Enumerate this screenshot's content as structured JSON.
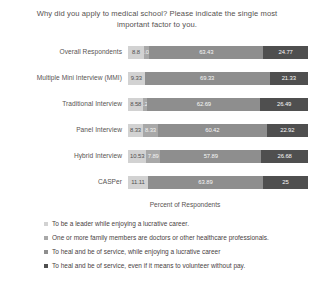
{
  "chart_data": {
    "type": "bar",
    "orientation": "horizontal",
    "stacked": true,
    "stack_mode": "percent",
    "title": "Why did you apply to medical school? Please indicate the single most important factor to you.",
    "xlabel": "Percent of Respondents",
    "ylabel": "",
    "xlim": [
      0,
      100
    ],
    "grid": false,
    "legend_position": "bottom-left",
    "categories": [
      "Overall Respondents",
      "Multiple Mini Interview (MMI)",
      "Traditional Interview",
      "Panel Interview",
      "Hybrid Interview",
      "CASPer"
    ],
    "series": [
      {
        "name": "To be a leader while enjoying a lucrative career.",
        "color": "#d2d2d2",
        "values": [
          8.8,
          9.33,
          8.58,
          8.33,
          10.53,
          11.11
        ]
      },
      {
        "name": "One or more family members are doctors or other healthcare professionals.",
        "color": "#a8a8a8",
        "values": [
          3.01,
          0,
          2.24,
          8.33,
          7.89,
          0
        ]
      },
      {
        "name": "To heal and be of service, while enjoying a lucrative career",
        "color": "#8e8e8e",
        "values": [
          63.43,
          69.33,
          62.69,
          60.42,
          57.89,
          63.89
        ]
      },
      {
        "name": "To heal and be of service, even if it means to volunteer without pay.",
        "color": "#4f4f4f",
        "values": [
          24.77,
          21.33,
          26.49,
          22.92,
          26.68,
          25
        ]
      }
    ],
    "rows": [
      {
        "label": "Overall Respondents",
        "segments": [
          {
            "value": 8.8,
            "display": "8.8"
          },
          {
            "value": 3.01,
            "display": "3.01"
          },
          {
            "value": 63.43,
            "display": "63.43"
          },
          {
            "value": 24.77,
            "display": "24.77"
          }
        ]
      },
      {
        "label": "Multiple Mini Interview (MMI)",
        "segments": [
          {
            "value": 9.33,
            "display": "9.33"
          },
          {
            "value": 0,
            "display": "0"
          },
          {
            "value": 69.33,
            "display": "69.33"
          },
          {
            "value": 21.33,
            "display": "21.33"
          }
        ]
      },
      {
        "label": "Traditional Interview",
        "segments": [
          {
            "value": 8.58,
            "display": "8.58"
          },
          {
            "value": 2.24,
            "display": "2.24"
          },
          {
            "value": 62.69,
            "display": "62.69"
          },
          {
            "value": 26.49,
            "display": "26.49"
          }
        ]
      },
      {
        "label": "Panel Interview",
        "segments": [
          {
            "value": 8.33,
            "display": "8.33"
          },
          {
            "value": 8.33,
            "display": "8.33"
          },
          {
            "value": 60.42,
            "display": "60.42"
          },
          {
            "value": 22.92,
            "display": "22.92"
          }
        ]
      },
      {
        "label": "Hybrid Interview",
        "segments": [
          {
            "value": 10.53,
            "display": "10.53"
          },
          {
            "value": 7.89,
            "display": "7.89"
          },
          {
            "value": 57.89,
            "display": "57.89"
          },
          {
            "value": 26.68,
            "display": "26.68"
          }
        ]
      },
      {
        "label": "CASPer",
        "segments": [
          {
            "value": 11.11,
            "display": "11.11"
          },
          {
            "value": 0,
            "display": "0"
          },
          {
            "value": 63.89,
            "display": "63.89"
          },
          {
            "value": 25,
            "display": "25"
          }
        ]
      }
    ],
    "legend": [
      {
        "label": "To be a leader while enjoying a lucrative career.",
        "color": "#d2d2d2"
      },
      {
        "label": "One or more family members are doctors or other healthcare professionals.",
        "color": "#a8a8a8"
      },
      {
        "label": "To heal and be of service, while enjoying a lucrative career",
        "color": "#8e8e8e"
      },
      {
        "label": "To heal and be of service, even if it means to volunteer without pay.",
        "color": "#4f4f4f"
      }
    ]
  }
}
